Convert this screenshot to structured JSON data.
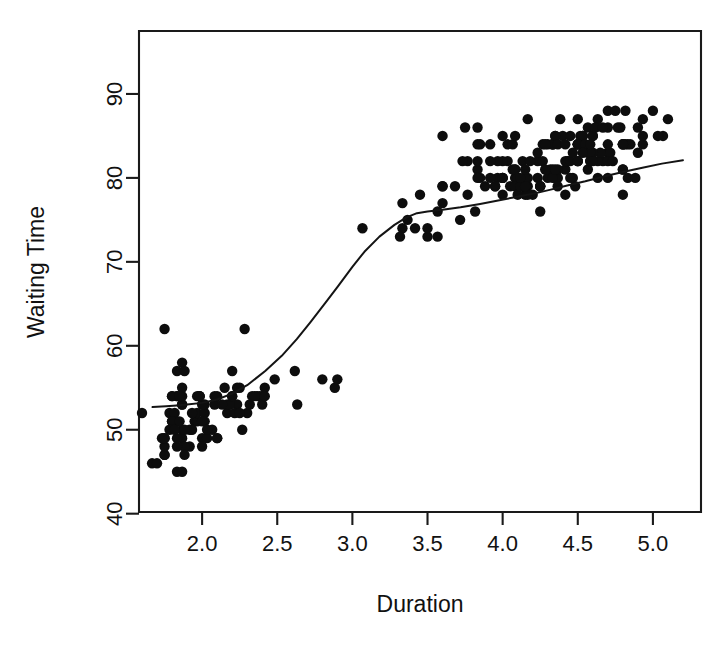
{
  "chart_data": {
    "type": "scatter",
    "title": "",
    "xlabel": "Duration",
    "ylabel": "Waiting Time",
    "xlim": [
      1.58,
      5.32
    ],
    "ylim": [
      40.2,
      97.5
    ],
    "xticks": [
      "2.0",
      "2.5",
      "3.0",
      "3.5",
      "4.0",
      "4.5",
      "5.0"
    ],
    "xtick_values": [
      2.0,
      2.5,
      3.0,
      3.5,
      4.0,
      4.5,
      5.0
    ],
    "yticks": [
      "40",
      "50",
      "60",
      "70",
      "80",
      "90"
    ],
    "ytick_values": [
      40,
      50,
      60,
      70,
      80,
      90
    ],
    "grid": false,
    "legend": "none",
    "point_color": "#0d0d0d",
    "curve_color": "#141414",
    "axis_color": "#1a1a1a",
    "background": "#ffffff",
    "series": [
      {
        "name": "eruptions",
        "marker": "filled-circle",
        "x": [
          3.6,
          1.8,
          3.333,
          2.283,
          4.533,
          2.883,
          4.7,
          3.6,
          1.95,
          4.35,
          1.833,
          3.917,
          4.2,
          1.75,
          4.7,
          2.167,
          1.75,
          4.8,
          1.6,
          4.25,
          1.8,
          1.75,
          3.45,
          3.067,
          4.533,
          3.6,
          1.967,
          4.083,
          3.85,
          4.433,
          4.3,
          4.467,
          3.367,
          4.033,
          3.833,
          2.017,
          1.867,
          4.833,
          1.833,
          4.783,
          4.35,
          1.883,
          4.567,
          1.75,
          4.533,
          3.317,
          3.833,
          2.1,
          4.633,
          2.0,
          4.8,
          4.716,
          1.833,
          4.833,
          1.733,
          4.883,
          3.717,
          1.667,
          4.567,
          4.317,
          2.233,
          4.5,
          1.75,
          4.8,
          1.817,
          4.4,
          4.167,
          4.7,
          2.067,
          4.7,
          4.033,
          1.967,
          4.5,
          4.0,
          1.983,
          5.067,
          2.017,
          4.567,
          3.883,
          3.6,
          4.133,
          4.333,
          4.1,
          2.633,
          4.067,
          4.933,
          3.95,
          4.517,
          2.167,
          4.0,
          2.2,
          4.333,
          1.867,
          4.817,
          1.833,
          4.3,
          4.667,
          3.75,
          1.867,
          4.9,
          2.483,
          4.367,
          2.1,
          4.5,
          4.05,
          1.867,
          4.7,
          1.783,
          4.85,
          3.683,
          4.733,
          2.3,
          4.9,
          4.417,
          1.7,
          4.633,
          2.317,
          4.6,
          1.817,
          4.417,
          2.617,
          4.067,
          4.25,
          1.967,
          4.6,
          3.767,
          1.917,
          4.5,
          2.267,
          4.65,
          1.867,
          4.167,
          2.8,
          4.333,
          1.833,
          4.383,
          1.883,
          4.933,
          2.033,
          3.733,
          4.233,
          2.233,
          4.533,
          4.817,
          4.333,
          1.983,
          4.633,
          2.017,
          5.1,
          1.8,
          5.033,
          4.0,
          2.4,
          4.6,
          3.567,
          4.0,
          4.5,
          4.083,
          1.8,
          3.967,
          2.2,
          4.15,
          2.0,
          3.833,
          3.5,
          4.583,
          2.367,
          5.0,
          1.933,
          4.617,
          1.917,
          2.083,
          4.583,
          3.333,
          4.167,
          4.333,
          4.5,
          2.417,
          4.0,
          4.167,
          1.883,
          4.583,
          4.25,
          3.767,
          2.033,
          4.433,
          4.083,
          1.833,
          4.417,
          2.183,
          4.8,
          1.833,
          4.8,
          4.1,
          3.966,
          4.233,
          3.5,
          4.366,
          2.25,
          4.667,
          2.1,
          4.35,
          4.133,
          1.867,
          4.6,
          1.783,
          4.367,
          3.85,
          1.933,
          4.5,
          2.383,
          4.7,
          1.867,
          3.833,
          3.417,
          4.233,
          2.4,
          4.8,
          2.0,
          4.15,
          1.867,
          4.267,
          1.75,
          4.483,
          4.0,
          4.117,
          4.083,
          4.267,
          3.917,
          4.55,
          4.083,
          2.417,
          4.183,
          2.217,
          4.45,
          1.883,
          1.85,
          4.283,
          3.95,
          2.333,
          4.15,
          2.35,
          4.933,
          2.9,
          4.583,
          3.833,
          2.083,
          4.367,
          2.133,
          4.35,
          2.2,
          4.45,
          3.567,
          4.5,
          4.15,
          3.817,
          3.917,
          4.45,
          2.0,
          4.283,
          4.767,
          4.533,
          1.85,
          4.25,
          1.983,
          2.25,
          4.75,
          4.117,
          2.15,
          4.417,
          1.817,
          4.467
        ],
        "y": [
          79,
          54,
          74,
          62,
          85,
          55,
          88,
          85,
          51,
          85,
          54,
          84,
          78,
          47,
          83,
          52,
          62,
          84,
          52,
          79,
          51,
          47,
          78,
          74,
          85,
          77,
          51,
          80,
          80,
          82,
          80,
          80,
          75,
          82,
          86,
          51,
          58,
          80,
          57,
          86,
          80,
          57,
          81,
          48,
          84,
          73,
          81,
          54,
          87,
          49,
          78,
          83,
          45,
          84,
          49,
          80,
          75,
          46,
          86,
          81,
          55,
          82,
          49,
          81,
          51,
          85,
          87,
          84,
          50,
          86,
          84,
          52,
          84,
          80,
          54,
          85,
          52,
          83,
          79,
          79,
          82,
          84,
          80,
          53,
          84,
          87,
          79,
          85,
          53,
          82,
          54,
          81,
          50,
          84,
          54,
          84,
          82,
          86,
          49,
          86,
          56,
          80,
          49,
          84,
          79,
          53,
          82,
          52,
          84,
          79,
          82,
          52,
          83,
          78,
          46,
          82,
          53,
          85,
          52,
          81,
          57,
          81,
          76,
          54,
          85,
          82,
          48,
          82,
          50,
          83,
          53,
          79,
          56,
          80,
          51,
          87,
          48,
          84,
          49,
          82,
          82,
          53,
          85,
          88,
          84,
          54,
          80,
          53,
          87,
          54,
          85,
          85,
          54,
          83,
          76,
          78,
          87,
          85,
          51,
          82,
          57,
          78,
          51,
          82,
          73,
          83,
          54,
          88,
          52,
          86,
          50,
          53,
          82,
          77,
          80,
          84,
          84,
          55,
          80,
          78,
          47,
          82,
          79,
          78,
          50,
          82,
          79,
          48,
          82,
          53,
          84,
          49,
          84,
          78,
          80,
          83,
          74,
          79,
          55,
          86,
          49,
          85,
          79,
          45,
          82,
          50,
          81,
          84,
          50,
          84,
          54,
          80,
          54,
          84,
          74,
          80,
          53,
          81,
          53,
          80,
          55,
          84,
          49,
          79,
          80,
          79,
          81,
          82,
          82,
          84,
          81,
          54,
          82,
          52,
          82,
          50,
          54,
          84,
          79,
          54,
          79,
          54,
          85,
          56,
          84,
          80,
          54,
          84,
          53,
          81,
          54,
          80,
          73,
          82,
          81,
          76,
          80,
          85,
          48,
          81,
          86,
          83,
          51,
          79,
          54,
          52,
          88,
          80,
          55,
          84,
          50,
          83
        ]
      }
    ],
    "smoother": {
      "name": "lowess",
      "x": [
        1.67,
        1.76,
        1.83,
        1.9,
        2.0,
        2.1,
        2.2,
        2.3,
        2.42,
        2.53,
        2.63,
        2.72,
        2.82,
        2.9,
        3.0,
        3.08,
        3.18,
        3.28,
        3.36,
        3.43,
        3.5,
        3.6,
        3.72,
        3.85,
        3.97,
        4.08,
        4.2,
        4.32,
        4.43,
        4.55,
        4.68,
        4.8,
        4.93,
        5.06,
        5.2
      ],
      "y": [
        52.7,
        52.8,
        52.9,
        53.0,
        53.2,
        53.6,
        54.3,
        55.3,
        57.0,
        58.8,
        60.8,
        62.8,
        65.1,
        67.0,
        69.4,
        71.2,
        73.0,
        74.4,
        75.3,
        75.8,
        76.0,
        76.2,
        76.5,
        76.9,
        77.3,
        77.7,
        78.1,
        78.6,
        79.1,
        79.6,
        80.2,
        80.7,
        81.2,
        81.7,
        82.1
      ]
    }
  },
  "figure": {
    "xlabel": "Duration",
    "ylabel": "Waiting Time"
  }
}
